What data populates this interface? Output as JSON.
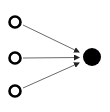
{
  "diagram": {
    "type": "many-to-one",
    "inputs": [
      {
        "id": "input-1",
        "cx": 15,
        "cy": 22,
        "r": 6
      },
      {
        "id": "input-2",
        "cx": 15,
        "cy": 58,
        "r": 6
      },
      {
        "id": "input-3",
        "cx": 15,
        "cy": 91,
        "r": 6
      }
    ],
    "output": {
      "id": "output",
      "cx": 92,
      "cy": 57,
      "r": 9
    },
    "colors": {
      "stroke": "#000000",
      "arrow": "#333333",
      "fill": "#000000",
      "background": "#ffffff"
    }
  }
}
